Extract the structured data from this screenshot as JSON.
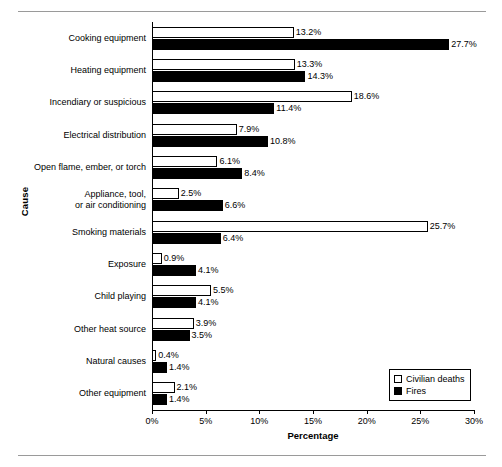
{
  "chart_data": {
    "type": "bar",
    "orientation": "horizontal",
    "title": "",
    "xlabel": "Percentage",
    "ylabel": "Cause",
    "xlim": [
      0,
      30
    ],
    "xticks": [
      "0%",
      "5%",
      "10%",
      "15%",
      "20%",
      "25%",
      "30%"
    ],
    "xtick_values": [
      0,
      5,
      10,
      15,
      20,
      25,
      30
    ],
    "grid": false,
    "legend_position": "bottom-right",
    "categories": [
      "Cooking equipment",
      "Heating equipment",
      "Incendiary or suspicious",
      "Electrical distribution",
      "Open flame, ember, or torch",
      "Appliance, tool,\nor air conditioning",
      "Smoking materials",
      "Exposure",
      "Child playing",
      "Other heat source",
      "Natural causes",
      "Other equipment"
    ],
    "series": [
      {
        "name": "Civilian deaths",
        "color": "#ffffff",
        "values": [
          13.2,
          13.3,
          18.6,
          7.9,
          6.1,
          2.5,
          25.7,
          0.9,
          5.5,
          3.9,
          0.4,
          2.1
        ],
        "labels": [
          "13.2%",
          "13.3%",
          "18.6%",
          "7.9%",
          "6.1%",
          "2.5%",
          "25.7%",
          "0.9%",
          "5.5%",
          "3.9%",
          "0.4%",
          "2.1%"
        ]
      },
      {
        "name": "Fires",
        "color": "#000000",
        "values": [
          27.7,
          14.3,
          11.4,
          10.8,
          8.4,
          6.6,
          6.4,
          4.1,
          4.1,
          3.5,
          1.4,
          1.4
        ],
        "labels": [
          "27.7%",
          "14.3%",
          "11.4%",
          "10.8%",
          "8.4%",
          "6.6%",
          "6.4%",
          "4.1%",
          "4.1%",
          "3.5%",
          "1.4%",
          "1.4%"
        ]
      }
    ]
  },
  "legend": {
    "items": [
      {
        "label": "Civilian deaths",
        "swatch": "white-square"
      },
      {
        "label": "Fires",
        "swatch": "black-square"
      }
    ]
  }
}
